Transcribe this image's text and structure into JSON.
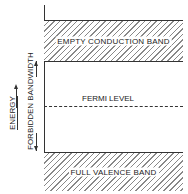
{
  "diagram": {
    "conduction_band_label": "EMPTY CONDUCTION BAND",
    "fermi_level_label": "FERMI LEVEL",
    "valence_band_label": "FULL VALENCE BAND",
    "axis_label": "ENERGY",
    "gap_label": "FORBIDDEN BANDWIDTH"
  }
}
